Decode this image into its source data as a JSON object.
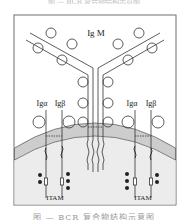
{
  "figure": {
    "top_caption": "图 — BCR 复合物结构示意图",
    "bottom_caption": "图 — BCR 复合物结构示意图",
    "labels": {
      "igm": "Ig M",
      "left_ig_alpha": "Igα",
      "left_ig_beta": "Igβ",
      "right_ig_alpha": "Igα",
      "right_ig_beta": "Igβ",
      "left_itam": "ITAM",
      "right_itam": "ITAM"
    },
    "colors": {
      "frame": "#6f6f6f",
      "membrane": "#cfcfcf",
      "cytoplasm": "#e6e6e6",
      "line": "#333333",
      "dot": "#222222"
    }
  }
}
